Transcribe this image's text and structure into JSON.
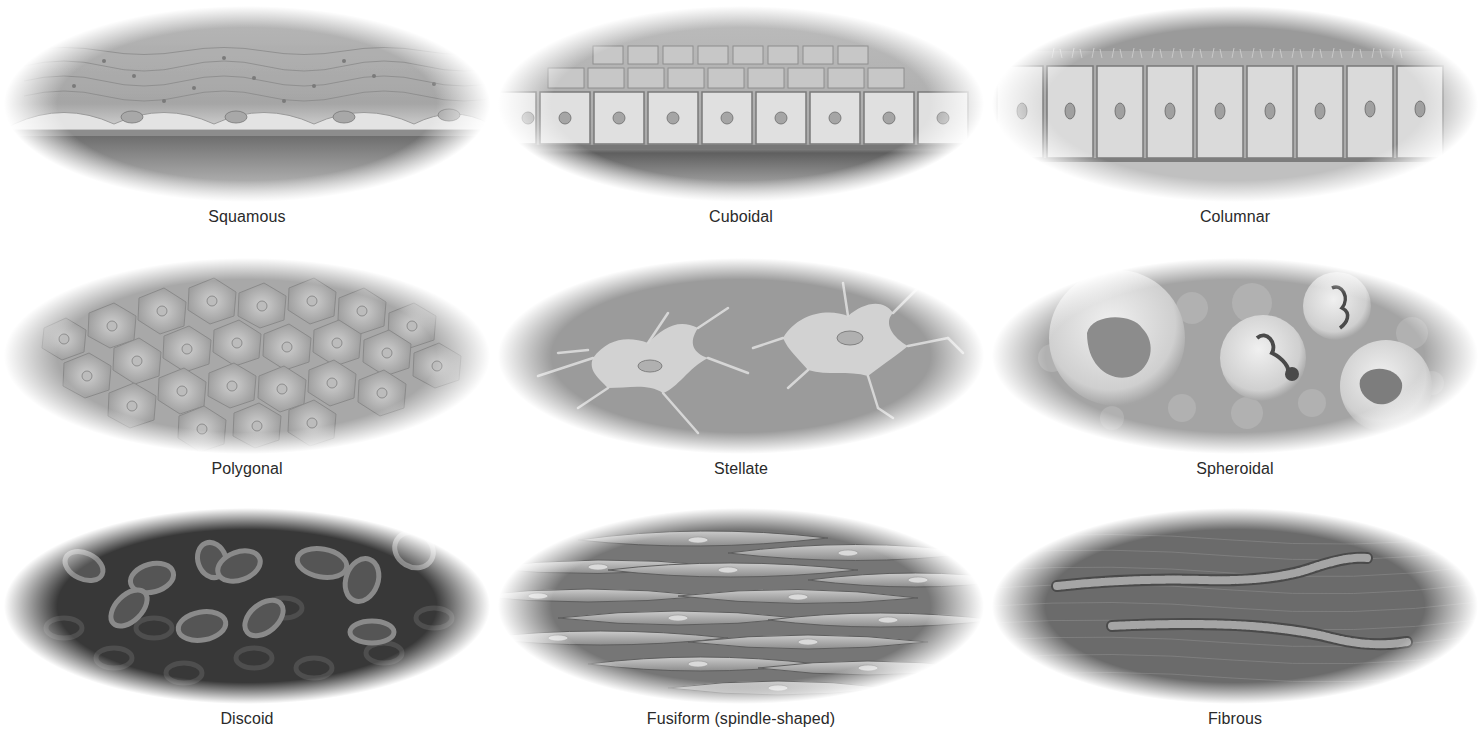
{
  "figure": {
    "rows": [
      {
        "cells": [
          {
            "label": "Squamous",
            "shape": "squamous"
          },
          {
            "label": "Cuboidal",
            "shape": "cuboidal"
          },
          {
            "label": "Columnar",
            "shape": "columnar"
          }
        ]
      },
      {
        "cells": [
          {
            "label": "Polygonal",
            "shape": "polygonal"
          },
          {
            "label": "Stellate",
            "shape": "stellate"
          },
          {
            "label": "Spheroidal",
            "shape": "spheroidal"
          }
        ]
      },
      {
        "cells": [
          {
            "label": "Discoid",
            "shape": "discoid"
          },
          {
            "label": "Fusiform (spindle-shaped)",
            "shape": "fusiform"
          },
          {
            "label": "Fibrous",
            "shape": "fibrous"
          }
        ]
      }
    ],
    "colors": {
      "background": "#ffffff",
      "label_text": "#2a2a2a",
      "cell_light": "#d8d8d8",
      "cell_mid": "#9a9a9a",
      "cell_dark": "#3a3a3a"
    }
  }
}
